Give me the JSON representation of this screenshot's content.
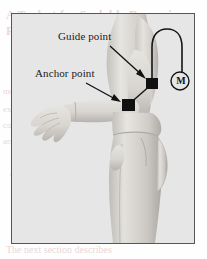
{
  "figure": {
    "panel_name": "anatomical-side-view-figure",
    "background_color": "#e6e6e6",
    "border_color": "#56565a",
    "annotations": [
      {
        "id": "guide-point",
        "label": "Guide point",
        "marker": "filled-square",
        "marker_color": "#111111",
        "marker_x": 140,
        "marker_y": 70,
        "label_x": 46,
        "label_y": 16,
        "leader_from_x": 98,
        "leader_from_y": 32,
        "leader_to_x": 133,
        "leader_to_y": 64
      },
      {
        "id": "anchor-point",
        "label": "Anchor point",
        "marker": "filled-square",
        "marker_color": "#111111",
        "marker_x": 116,
        "marker_y": 91,
        "label_x": 23,
        "label_y": 53,
        "leader_from_x": 74,
        "leader_from_y": 69,
        "leader_to_x": 109,
        "leader_to_y": 88
      }
    ],
    "device": {
      "id": "measurement-unit",
      "label": "M",
      "shape": "circle",
      "center_x": 168,
      "center_y": 67,
      "radius": 9,
      "stroke_color": "#141414"
    },
    "cable": {
      "id": "sensor-cable",
      "color": "#141414",
      "description": "cable from guide-point marker looping over shoulder down to measurement unit"
    },
    "connector_line": {
      "id": "marker-connector",
      "color": "#141414",
      "description": "straight segment joining anchor point marker to guide point marker"
    }
  },
  "background_text": {
    "line1": "A Toolset for Scalable Dynamic",
    "line2": "Recreation Controlling",
    "line3": "mechanical movement of the",
    "line4": "experimental setup and the",
    "line5": "configuration of the sensor",
    "line6": "array which is positioned",
    "line7": "along the forearm",
    "line8": "as shown in Figure 4",
    "line9": "The next section describes"
  }
}
